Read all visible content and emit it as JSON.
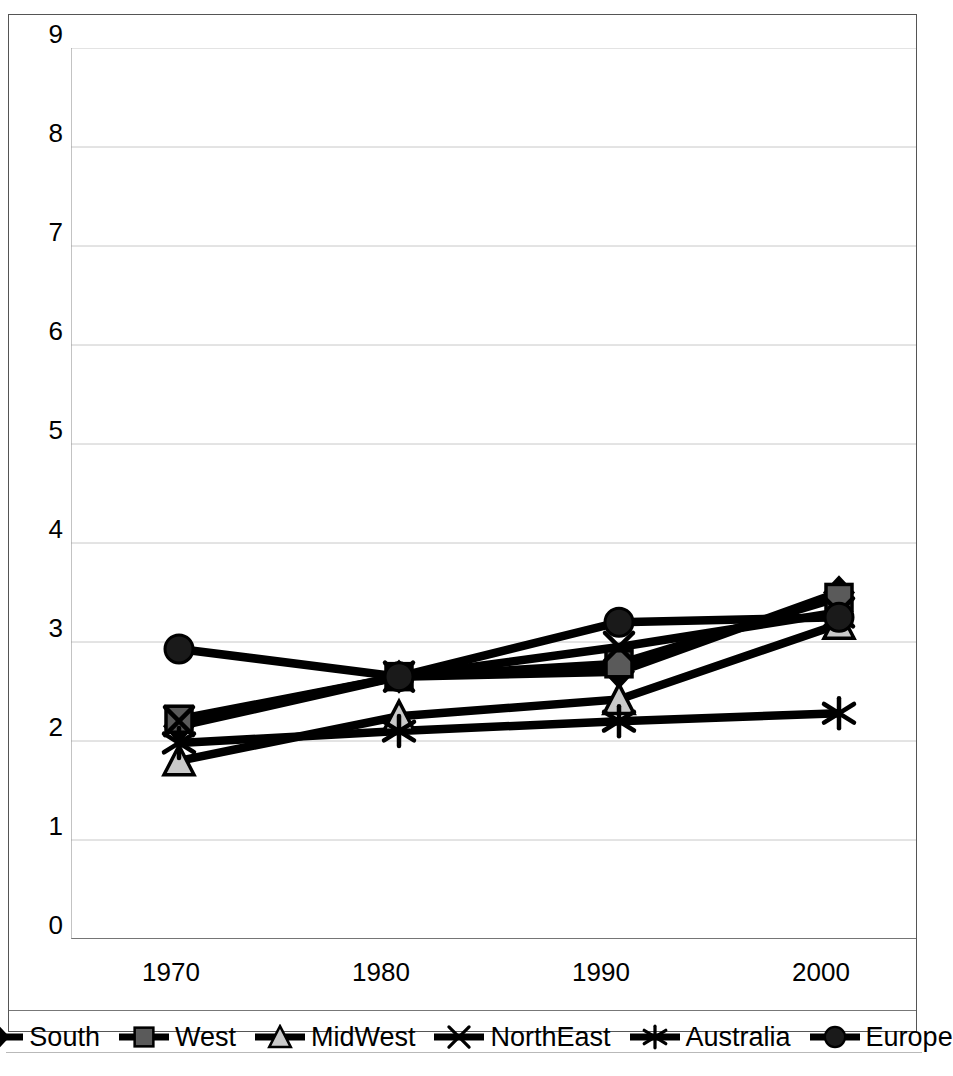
{
  "chart_data": {
    "type": "line",
    "title": "",
    "xlabel": "",
    "ylabel": "",
    "categories": [
      "1970",
      "1980",
      "1990",
      "2000"
    ],
    "ylim": [
      0,
      9
    ],
    "yticks": [
      0,
      1,
      2,
      3,
      4,
      5,
      6,
      7,
      8,
      9
    ],
    "ytick_labels": [
      "0",
      "1",
      "2",
      "3",
      "4",
      "5",
      "6",
      "7",
      "8",
      "9"
    ],
    "grid": "horizontal",
    "legend_position": "bottom",
    "series": [
      {
        "name": "South",
        "marker": "diamond",
        "color": "#000000",
        "values": [
          2.15,
          2.65,
          2.7,
          3.5
        ]
      },
      {
        "name": "West",
        "marker": "square",
        "color": "#5a5a5a",
        "values": [
          2.22,
          2.65,
          2.78,
          3.45
        ]
      },
      {
        "name": "MidWest",
        "marker": "triangle",
        "color": "#c9c9c9",
        "values": [
          1.8,
          2.25,
          2.42,
          3.18
        ]
      },
      {
        "name": "NorthEast",
        "marker": "cross-x",
        "color": "#000000",
        "values": [
          2.2,
          2.65,
          2.95,
          3.3
        ]
      },
      {
        "name": "Australia",
        "marker": "asterisk",
        "color": "#000000",
        "values": [
          1.98,
          2.1,
          2.2,
          2.28
        ]
      },
      {
        "name": "Europe",
        "marker": "circle",
        "color": "#1a1a1a",
        "values": [
          2.93,
          2.65,
          3.2,
          3.25
        ]
      }
    ]
  },
  "legend": {
    "items": [
      {
        "label": "South",
        "marker": "diamond-marker-icon"
      },
      {
        "label": "West",
        "marker": "square-marker-icon"
      },
      {
        "label": "MidWest",
        "marker": "triangle-marker-icon"
      },
      {
        "label": "NorthEast",
        "marker": "cross-marker-icon"
      },
      {
        "label": "Australia",
        "marker": "asterisk-marker-icon"
      },
      {
        "label": "Europe",
        "marker": "circle-marker-icon"
      }
    ]
  },
  "axes": {
    "x_labels": [
      "1970",
      "1980",
      "1990",
      "2000"
    ],
    "y_labels": [
      "9",
      "8",
      "7",
      "6",
      "5",
      "4",
      "3",
      "2",
      "1",
      "0"
    ]
  }
}
